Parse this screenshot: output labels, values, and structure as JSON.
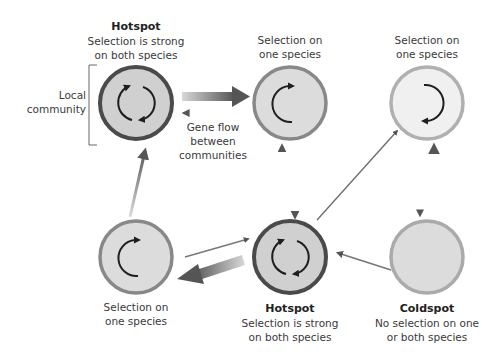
{
  "colors": {
    "hotspot_ring": "#4a4a4a",
    "one_species_ring": "#8a8a8a",
    "light_ring": "#b0b0b0",
    "fill_dark": "#d0d0d0",
    "fill_mid": "#dcdcdc",
    "fill_light": "#efefef",
    "cycle_arrow": "#1e1e1e",
    "flow_arrow": "#6b6b6b"
  },
  "communities": [
    {
      "id": "top-left",
      "type": "hotspot",
      "title": "Hotspot",
      "line1": "Selection is strong",
      "line2": "on both species",
      "cycle": "both"
    },
    {
      "id": "top-middle",
      "type": "one-species",
      "title": "",
      "line1": "Selection on",
      "line2": "one species",
      "cycle": "left"
    },
    {
      "id": "top-right",
      "type": "one-species-light",
      "title": "",
      "line1": "Selection on",
      "line2": "one species",
      "cycle": "right"
    },
    {
      "id": "bottom-left",
      "type": "one-species",
      "title": "",
      "line1": "Selection on",
      "line2": "one species",
      "cycle": "left"
    },
    {
      "id": "bottom-middle",
      "type": "hotspot",
      "title": "Hotspot",
      "line1": "Selection is strong",
      "line2": "on both species",
      "cycle": "both"
    },
    {
      "id": "bottom-right",
      "type": "coldspot",
      "title": "Coldspot",
      "line1": "No selection on one",
      "line2": "or both species",
      "cycle": "none"
    }
  ],
  "annotations": {
    "local_community": {
      "line1": "Local",
      "line2": "community"
    },
    "gene_flow": {
      "line1": "Gene flow",
      "line2": "between",
      "line3": "communities"
    }
  }
}
